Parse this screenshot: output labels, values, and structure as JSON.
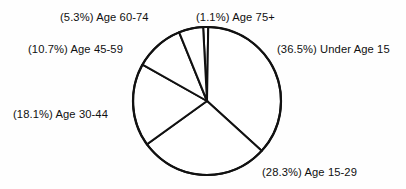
{
  "chart_data": {
    "type": "pie",
    "title": "",
    "subtitle": "",
    "xlabel": "",
    "ylabel": "",
    "legend_position": "none",
    "grid": false,
    "units": "percent",
    "start_angle_deg": -3,
    "direction": "clockwise",
    "categories": [
      "Age 75+",
      "Under Age 15",
      "Age 15-29",
      "Age 30-44",
      "Age 45-59",
      "Age 60-74"
    ],
    "values": [
      1.1,
      36.5,
      28.3,
      18.1,
      10.7,
      5.3
    ],
    "slices": [
      {
        "label": "Age 75+",
        "value": 1.1,
        "label_text": "(1.1%) Age 75+",
        "percent_text": "(1.1%)",
        "name_text": "Age 75+"
      },
      {
        "label": "Under Age 15",
        "value": 36.5,
        "label_text": "(36.5%) Under Age 15",
        "percent_text": "(36.5%)",
        "name_text": "Under Age 15"
      },
      {
        "label": "Age 15-29",
        "value": 28.3,
        "label_text": "(28.3%) Age 15-29",
        "percent_text": "(28.3%)",
        "name_text": "Age 15-29"
      },
      {
        "label": "Age 30-44",
        "value": 18.1,
        "label_text": "(18.1%) Age 30-44",
        "percent_text": "(18.1%)",
        "name_text": "Age 30-44"
      },
      {
        "label": "Age 45-59",
        "value": 10.7,
        "label_text": "(10.7%) Age 45-59",
        "percent_text": "(10.7%)",
        "name_text": "Age 45-59"
      },
      {
        "label": "Age 60-74",
        "value": 5.3,
        "label_text": "(5.3%) Age 60-74",
        "percent_text": "(5.3%)",
        "name_text": "Age 60-74"
      }
    ],
    "colors": {
      "slice_fill": "#ffffff",
      "slice_stroke": "#111111",
      "text": "#101010",
      "background": "#fefefe"
    },
    "geometry": {
      "center_x": 207,
      "center_y": 101,
      "radius": 74
    }
  },
  "labels": {
    "age_60_74": "(5.3%) Age 60-74",
    "age_75_plus": "(1.1%) Age 75+",
    "age_45_59": "(10.7%) Age 45-59",
    "age_30_44": "(18.1%) Age 30-44",
    "under_age_15": "(36.5%) Under Age 15",
    "age_15_29": "(28.3%) Age 15-29"
  }
}
